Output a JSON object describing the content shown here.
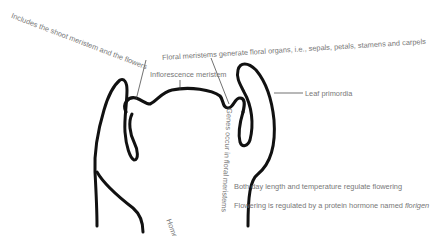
{
  "diagram": {
    "outline_color": "#111111",
    "label_color": "#777777",
    "labels": {
      "includes": "Includes the shoot meristem and the flowers",
      "floral_meristems": "Floral meristems generate floral organs, i.e., sepals, petals, stamens and carpels",
      "inflorescence": "Inflorescence meristem",
      "leaf_primordia": "Leaf primordia",
      "homeotic": "Homeotic genes encode proteins",
      "genes_occur": "Genes occur in floral meristems",
      "day_length": "Both day length and temperature regulate flowering",
      "florigen_prefix": "Flowering is regulated by a protein hormone named ",
      "florigen_term": "florigen"
    }
  }
}
